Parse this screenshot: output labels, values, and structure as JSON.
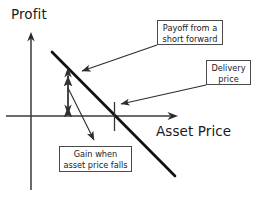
{
  "figure": {
    "type": "payoff-diagram",
    "instrument": "short forward contract",
    "axes": {
      "y_label": "Profit",
      "x_label": "Asset Price",
      "origin": {
        "x": 31,
        "y": 116
      },
      "y_axis": {
        "x": 31,
        "top": 33,
        "bottom": 190,
        "arrow": "up"
      },
      "x_axis": {
        "y": 116,
        "left": 6,
        "right": 178,
        "arrow": "right"
      }
    },
    "payoff_line": {
      "description": "Downward sloping payoff of a short forward position",
      "from": {
        "x": 52,
        "y": 52
      },
      "to": {
        "x": 175,
        "y": 176
      },
      "stroke_width": 2.6,
      "color": "#111111"
    },
    "delivery_price_tick": {
      "x": 114,
      "top": 102,
      "bottom": 131,
      "color": "#333333"
    },
    "gain_measure_arrow": {
      "description": "Double headed vertical arrow measuring the gain",
      "x": 68,
      "top": 68,
      "bottom": 113,
      "color": "#333333"
    }
  },
  "callouts": [
    {
      "id": "payoff",
      "lines": [
        "Payoff from a",
        "short forward"
      ],
      "pointer": {
        "from": {
          "x": 157,
          "y": 45
        },
        "to": {
          "x": 78,
          "y": 73
        }
      }
    },
    {
      "id": "delivery",
      "lines": [
        "Delivery",
        "price"
      ],
      "pointer": {
        "from": {
          "x": 206,
          "y": 85
        },
        "to": {
          "x": 117,
          "y": 105
        }
      }
    },
    {
      "id": "gain",
      "lines": [
        "Gain when",
        "asset price falls"
      ],
      "pointer": {
        "from": {
          "x": 68,
          "y": 88
        },
        "to": {
          "x": 97,
          "y": 144
        }
      }
    }
  ],
  "colors": {
    "ink": "#1a1a1a",
    "line": "#111111",
    "thin": "#333333",
    "box_border": "#4a4a4a",
    "background": "#ffffff"
  }
}
